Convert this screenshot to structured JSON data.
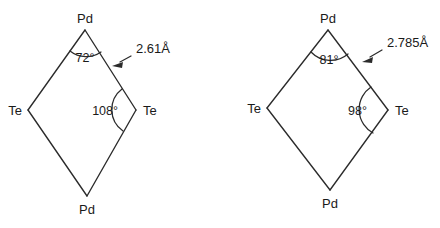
{
  "figure": {
    "background_color": "#ffffff",
    "stroke_color": "#2b2b2b",
    "text_color": "#1a1a1a",
    "type": "chemical-structure-diagram"
  },
  "structures": [
    {
      "id": "left-structure",
      "vertices": {
        "top": "Pd",
        "left": "Te",
        "right": "Te",
        "bottom": "Pd"
      },
      "angles": {
        "top": "72°",
        "right": "108°"
      },
      "bond_length": "2.61Å"
    },
    {
      "id": "right-structure",
      "vertices": {
        "top": "Pd",
        "left": "Te",
        "right": "Te",
        "bottom": "Pd"
      },
      "angles": {
        "top": "81°",
        "right": "98°"
      },
      "bond_length": "2.785Å"
    }
  ]
}
